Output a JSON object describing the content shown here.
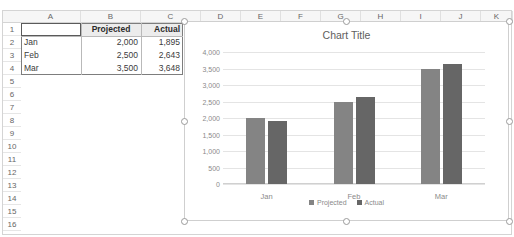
{
  "app": {
    "top_ghost_text": "–  –  –   –  –   –  –  –   –  –"
  },
  "spreadsheet": {
    "column_headers": [
      "A",
      "B",
      "C",
      "D",
      "E",
      "F",
      "G",
      "H",
      "I",
      "J",
      "K"
    ],
    "row_headers": [
      "1",
      "2",
      "3",
      "4",
      "5",
      "6",
      "7",
      "8",
      "9",
      "10",
      "11",
      "12",
      "13",
      "14",
      "15",
      "16"
    ],
    "select_all_name": "select-all",
    "table": {
      "header_row": [
        "",
        "Projected",
        "Actual"
      ],
      "rows": [
        {
          "label": "Jan",
          "projected": "2,000",
          "actual": "1,895"
        },
        {
          "label": "Feb",
          "projected": "2,500",
          "actual": "2,643"
        },
        {
          "label": "Mar",
          "projected": "3,500",
          "actual": "3,648"
        }
      ]
    },
    "active_cell": "A1"
  },
  "chart": {
    "title": "Chart Title",
    "selected": true,
    "handle_count": 8
  },
  "chart_data": {
    "type": "bar",
    "title": "Chart Title",
    "categories": [
      "Jan",
      "Feb",
      "Mar"
    ],
    "series": [
      {
        "name": "Projected",
        "values": [
          2000,
          2500,
          3500
        ],
        "color": "#848484"
      },
      {
        "name": "Actual",
        "values": [
          1895,
          2643,
          3648
        ],
        "color": "#666666"
      }
    ],
    "xlabel": "",
    "ylabel": "",
    "ylim": [
      0,
      4000
    ],
    "yticks": [
      0,
      500,
      1000,
      1500,
      2000,
      2500,
      3000,
      3500,
      4000
    ],
    "ytick_labels": [
      "0",
      "500",
      "1,000",
      "1,500",
      "2,000",
      "2,500",
      "3,000",
      "3,500",
      "4,000"
    ],
    "grid": true,
    "legend_position": "bottom"
  },
  "colors": {
    "projected": "#848484",
    "actual": "#666666",
    "gridline": "#e4e4e4",
    "header_fill": "#ececec"
  }
}
